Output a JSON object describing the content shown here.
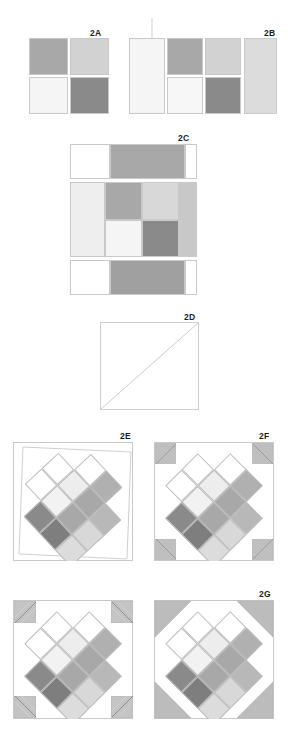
{
  "diagram": {
    "steps": [
      {
        "id": "2A",
        "label": "2A"
      },
      {
        "id": "2B",
        "label": "2B"
      },
      {
        "id": "2C",
        "label": "2C"
      },
      {
        "id": "2D",
        "label": "2D"
      },
      {
        "id": "2E",
        "label": "2E"
      },
      {
        "id": "2F",
        "label": "2F"
      },
      {
        "id": "2G",
        "label": "2G"
      }
    ]
  },
  "colors": {
    "medium_gray": "#a8a8a8",
    "light_gray": "#d2d2d2",
    "pale_gray": "#ededed",
    "near_white": "#f7f7f7",
    "dark_gray": "#8a8a8a",
    "darker_gray": "#7e7e7e",
    "white": "#ffffff",
    "outline": "#c9c9c9",
    "cell_outline": "#bdbdbd",
    "label_color": "#1c1c1c",
    "corner_gray": "#bfbfbf",
    "stitch_line": "#b4b4b4"
  },
  "step_2a": {
    "label": "2A",
    "patches": [
      {
        "name": "top-left",
        "color": "#a8a8a8"
      },
      {
        "name": "top-right",
        "color": "#d2d2d2"
      },
      {
        "name": "bottom-left",
        "color": "#f5f5f5"
      },
      {
        "name": "bottom-right",
        "color": "#8a8a8a"
      }
    ]
  },
  "step_2b": {
    "label": "2B",
    "left_strip": {
      "name": "left-rectangle",
      "color": "#f5f5f5"
    },
    "center_patches": [
      {
        "name": "top-left",
        "color": "#a8a8a8"
      },
      {
        "name": "top-right",
        "color": "#d2d2d2"
      },
      {
        "name": "bottom-left",
        "color": "#f7f7f7"
      },
      {
        "name": "bottom-right",
        "color": "#8a8a8a"
      }
    ],
    "right_strip": {
      "name": "right-rectangle",
      "color": "#dcdcdc"
    }
  },
  "step_2c": {
    "label": "2C",
    "top_row": [
      {
        "name": "top-left-white",
        "color": "#ffffff"
      },
      {
        "name": "top-center-gray",
        "color": "#a8a8a8"
      },
      {
        "name": "top-right-white",
        "color": "#ffffff"
      }
    ],
    "middle_row": [
      {
        "name": "mid-left-strip",
        "color": "#eeeeee"
      },
      {
        "name": "center-top-left",
        "color": "#a8a8a8"
      },
      {
        "name": "center-top-right",
        "color": "#d8d8d8"
      },
      {
        "name": "center-bottom-left",
        "color": "#f5f5f5"
      },
      {
        "name": "center-bottom-right",
        "color": "#8a8a8a"
      },
      {
        "name": "mid-right-strip",
        "color": "#c8c8c8"
      }
    ],
    "bottom_row": [
      {
        "name": "bottom-left-white",
        "color": "#ffffff"
      },
      {
        "name": "bottom-center-gray",
        "color": "#a0a0a0"
      },
      {
        "name": "bottom-right-white",
        "color": "#ffffff"
      }
    ]
  },
  "step_2d": {
    "label": "2D",
    "square": {
      "name": "plain-white-square",
      "color": "#ffffff"
    },
    "diagonal": {
      "name": "diagonal-guide-line",
      "from": "bottom-left",
      "to": "top-right"
    }
  },
  "step_2e": {
    "label": "2E",
    "note": "rotated diamond unit with sashing outline, no corner triangles"
  },
  "step_2f": {
    "label": "2F",
    "note": "diamond unit with four gray corner triangles pinned, diagonal guide lines shown"
  },
  "step_2h": {
    "label": "",
    "note": "diamond unit with corner triangles and stitch guide lines"
  },
  "step_2g": {
    "label": "2G",
    "note": "completed block with four solid gray corner triangles"
  },
  "diamond_cells": {
    "grid": "4x4 rotated 45 degrees",
    "rows": [
      [
        "#ffffff",
        "#ffffff",
        "#ffffff",
        "#ffffff"
      ],
      [
        "#ffffff",
        "#efefef",
        "#a8a8a8",
        "#ffffff"
      ],
      [
        "#ffffff",
        "#f2f2f2",
        "#a8a8a8",
        "#d6d6d6"
      ],
      [
        "#ffffff",
        "#8a8a8a",
        "#7e7e7e",
        "#dcdcdc"
      ]
    ],
    "cells": [
      {
        "r": 0,
        "c": 1,
        "color": "#ffffff"
      },
      {
        "r": 0,
        "c": 2,
        "color": "#b0b0b0"
      },
      {
        "r": 1,
        "c": 0,
        "color": "#ffffff"
      },
      {
        "r": 1,
        "c": 1,
        "color": "#ededed"
      },
      {
        "r": 1,
        "c": 2,
        "color": "#a8a8a8"
      },
      {
        "r": 1,
        "c": 3,
        "color": "#b8b8b8"
      },
      {
        "r": 2,
        "c": 0,
        "color": "#ffffff"
      },
      {
        "r": 2,
        "c": 1,
        "color": "#f2f2f2"
      },
      {
        "r": 2,
        "c": 2,
        "color": "#a8a8a8"
      },
      {
        "r": 2,
        "c": 3,
        "color": "#d8d8d8"
      },
      {
        "r": 3,
        "c": 1,
        "color": "#8a8a8a"
      },
      {
        "r": 3,
        "c": 2,
        "color": "#7e7e7e"
      },
      {
        "r": 3,
        "c": 3,
        "color": "#dcdcdc"
      }
    ]
  }
}
